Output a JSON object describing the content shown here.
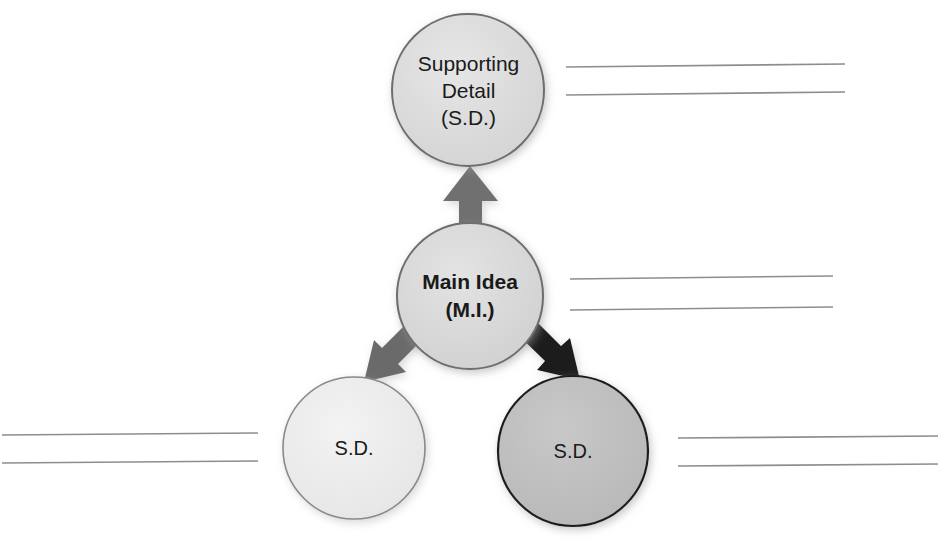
{
  "diagram": {
    "type": "main-idea-supporting-detail-web",
    "background_color": "#ffffff",
    "nodes": [
      {
        "id": "sd-top",
        "role": "supporting-detail",
        "lines": [
          "Supporting",
          "Detail",
          "(S.D.)"
        ],
        "fill": "#dcdcdc",
        "stroke": "#6e6e6e",
        "text_color": "#1a1a1a",
        "bold": false,
        "cx": 468,
        "cy": 90,
        "r": 76
      },
      {
        "id": "main-idea",
        "role": "main-idea",
        "lines": [
          "Main Idea",
          "(M.I.)"
        ],
        "fill": "#d9d9d9",
        "stroke": "#6e6e6e",
        "text_color": "#111111",
        "bold": true,
        "cx": 470,
        "cy": 296,
        "r": 74
      },
      {
        "id": "sd-bottom-left",
        "role": "supporting-detail",
        "lines": [
          "S.D."
        ],
        "fill": "#ececec",
        "stroke": "#8a8a8a",
        "text_color": "#1a1a1a",
        "bold": false,
        "cx": 354,
        "cy": 448,
        "r": 71
      },
      {
        "id": "sd-bottom-right",
        "role": "supporting-detail",
        "lines": [
          "S.D."
        ],
        "fill": "#bfbfbf",
        "stroke": "#1f1f1f",
        "text_color": "#1a1a1a",
        "bold": false,
        "cx": 573,
        "cy": 451,
        "r": 75
      }
    ],
    "arrows": [
      {
        "id": "arrow-up",
        "direction": "up",
        "from": "main-idea",
        "to": "sd-top",
        "color": "#707070"
      },
      {
        "id": "arrow-down-left",
        "direction": "down-left",
        "from": "main-idea",
        "to": "sd-bottom-left",
        "color": "#6b6b6b"
      },
      {
        "id": "arrow-down-right",
        "direction": "down-right",
        "from": "main-idea",
        "to": "sd-bottom-right",
        "color": "#1a1a1a"
      }
    ],
    "writing_line_groups": [
      {
        "id": "lines-top-right",
        "near_node": "sd-top",
        "color": "#8d8d8d",
        "lines": [
          {
            "x1": 566,
            "y1": 67,
            "x2": 845,
            "y2": 64
          },
          {
            "x1": 566,
            "y1": 95,
            "x2": 845,
            "y2": 92
          }
        ]
      },
      {
        "id": "lines-main-right",
        "near_node": "main-idea",
        "color": "#8d8d8d",
        "lines": [
          {
            "x1": 570,
            "y1": 279,
            "x2": 833,
            "y2": 276
          },
          {
            "x1": 570,
            "y1": 310,
            "x2": 833,
            "y2": 307
          }
        ]
      },
      {
        "id": "lines-bottom-left",
        "near_node": "sd-bottom-left",
        "color": "#8d8d8d",
        "lines": [
          {
            "x1": 2,
            "y1": 435,
            "x2": 258,
            "y2": 433
          },
          {
            "x1": 2,
            "y1": 463,
            "x2": 258,
            "y2": 461
          }
        ]
      },
      {
        "id": "lines-bottom-right",
        "near_node": "sd-bottom-right",
        "color": "#8d8d8d",
        "lines": [
          {
            "x1": 678,
            "y1": 438,
            "x2": 938,
            "y2": 436
          },
          {
            "x1": 678,
            "y1": 466,
            "x2": 938,
            "y2": 464
          }
        ]
      }
    ]
  }
}
